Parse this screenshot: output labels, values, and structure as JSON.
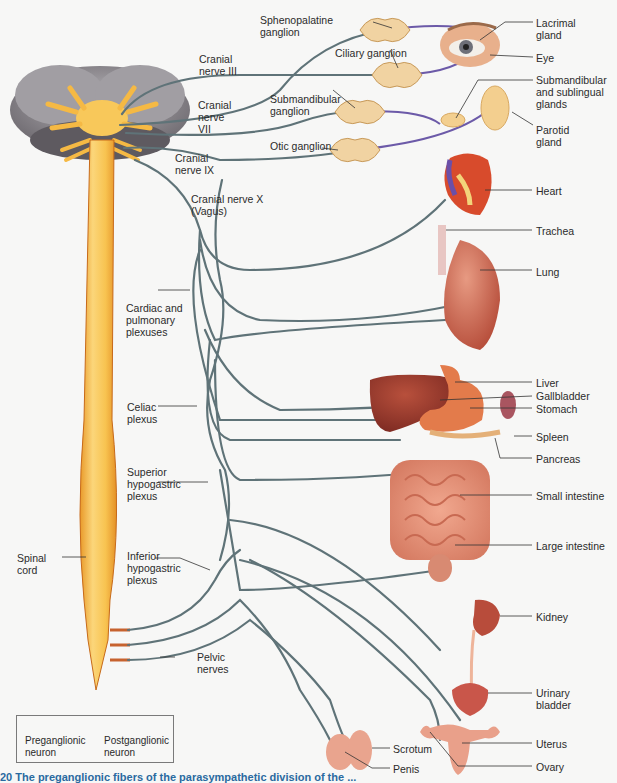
{
  "figure": {
    "labels": {
      "sphenopalatine_ganglion": "Sphenopalatine\nganglion",
      "ciliary_ganglion": "Ciliary ganglion",
      "cranial_nerve_iii": "Cranial\nnerve III",
      "cranial_nerve_vii": "Cranial\nnerve\nVII",
      "submandibular_ganglion": "Submandibular\nganglion",
      "otic_ganglion": "Otic ganglion",
      "cranial_nerve_ix": "Cranial\nnerve IX",
      "cranial_nerve_x": "Cranial nerve X\n(Vagus)",
      "cardiac_pulmonary_plexuses": "Cardiac and\npulmonary\nplexuses",
      "celiac_plexus": "Celiac\nplexus",
      "superior_hypogastric_plexus": "Superior\nhypogastric\nplexus",
      "inferior_hypogastric_plexus": "Inferior\nhypogastric\nplexus",
      "spinal_cord": "Spinal\ncord",
      "pelvic_nerves": "Pelvic\nnerves",
      "lacrimal_gland": "Lacrimal\ngland",
      "eye": "Eye",
      "submandibular_sublingual_glands": "Submandibular\nand sublingual\nglands",
      "parotid_gland": "Parotid\ngland",
      "heart": "Heart",
      "trachea": "Trachea",
      "lung": "Lung",
      "liver": "Liver",
      "gallbladder": "Gallbladder",
      "stomach": "Stomach",
      "spleen": "Spleen",
      "pancreas": "Pancreas",
      "small_intestine": "Small intestine",
      "large_intestine": "Large intestine",
      "kidney": "Kidney",
      "urinary_bladder": "Urinary\nbladder",
      "scrotum": "Scrotum",
      "penis": "Penis",
      "uterus": "Uterus",
      "ovary": "Ovary"
    },
    "legend": {
      "preganglionic": "Preganglionic\nneuron",
      "postganglionic": "Postganglionic\nneuron"
    },
    "caption_fragment": "20  The preganglionic fibers of the parasympathetic division of the ..."
  },
  "colors": {
    "preganglionic": "#5f7378",
    "postganglionic": "#6c5aa8",
    "spinal_cord": "#f6c452",
    "brain": "#8d8a8f",
    "organ": "#c9604a",
    "ganglion": "#f1d3a2",
    "caption": "#2a6aa0"
  }
}
